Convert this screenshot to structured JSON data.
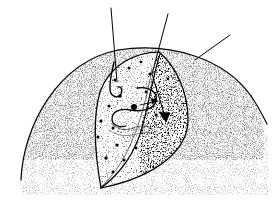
{
  "figure": {
    "title": "Stippled pen-and-ink anatomical illustration",
    "caption": "",
    "style": "pen-and-ink stipple engraving",
    "background_color": "#ffffff",
    "ink_color": "#000000",
    "stipple_color": "#111111",
    "line_weight_px": 1.1
  },
  "canvas": {
    "width": 276,
    "height": 210
  },
  "elements": {
    "outer_body": {
      "name": "outer stippled body mass",
      "description": "Large lightly stippled dome / rounded mass forming the background organ.",
      "outline_visible": true,
      "stipple_density": "light",
      "bounds": {
        "x": 20,
        "y": 47,
        "width": 248,
        "height": 140
      }
    },
    "central_organ": {
      "name": "central lens-shaped organ",
      "description": "Pointed-oval (leaf / lens) shaped organ tilted to the right, occupying the middle of the field.",
      "stipple_density": "medium",
      "tip_top": {
        "x": 160,
        "y": 52
      },
      "tip_bottom": {
        "x": 100,
        "y": 188
      },
      "bounds": {
        "x": 88,
        "y": 50,
        "width": 96,
        "height": 140
      }
    },
    "shaded_crescent": {
      "name": "dark shaded crescent",
      "description": "Heavily stippled / dense dark crescent along the right flank of the central organ indicating depth.",
      "stipple_density": "heavy",
      "bounds": {
        "x": 140,
        "y": 52,
        "width": 52,
        "height": 132
      }
    },
    "internal_hook": {
      "name": "hooked duct",
      "description": "Small hook-shaped internal line near upper-left of the central organ."
    },
    "internal_s_curve": {
      "name": "s-shaped structure",
      "description": "Open S / question-mark shaped internal line at the centre of the organ."
    },
    "internal_squiggle": {
      "name": "fine squiggle detail",
      "description": "Fine illegible cursive-like squiggle marks below the S-curve."
    },
    "arrow": {
      "name": "direction arrow",
      "description": "Small arrowhead at the end of the middle leader line pointing down-right into the shaded crescent.",
      "from": {
        "x": 152,
        "y": 74
      },
      "to": {
        "x": 167,
        "y": 122
      }
    },
    "dark_dots": {
      "name": "dark punctate spots",
      "description": "Scattered solid black dots (punctate markings) inside the central organ.",
      "count": 18,
      "points": [
        {
          "x": 129,
          "y": 68,
          "r": 1.5
        },
        {
          "x": 141,
          "y": 62,
          "r": 1.3
        },
        {
          "x": 115,
          "y": 80,
          "r": 1.4
        },
        {
          "x": 150,
          "y": 74,
          "r": 1.6
        },
        {
          "x": 168,
          "y": 79,
          "r": 1.3
        },
        {
          "x": 120,
          "y": 96,
          "r": 1.8
        },
        {
          "x": 109,
          "y": 106,
          "r": 1.6
        },
        {
          "x": 134,
          "y": 107,
          "r": 3.0
        },
        {
          "x": 146,
          "y": 92,
          "r": 1.4
        },
        {
          "x": 101,
          "y": 121,
          "r": 1.6
        },
        {
          "x": 113,
          "y": 128,
          "r": 1.5
        },
        {
          "x": 156,
          "y": 115,
          "r": 1.4
        },
        {
          "x": 98,
          "y": 137,
          "r": 1.5
        },
        {
          "x": 117,
          "y": 145,
          "r": 1.6
        },
        {
          "x": 106,
          "y": 158,
          "r": 1.7
        },
        {
          "x": 124,
          "y": 160,
          "r": 1.5
        },
        {
          "x": 136,
          "y": 148,
          "r": 1.4
        },
        {
          "x": 113,
          "y": 172,
          "r": 1.4
        }
      ]
    }
  },
  "leader_lines": [
    {
      "id": "leader-left",
      "label": "",
      "from": {
        "x": 111,
        "y": 8
      },
      "to": {
        "x": 117,
        "y": 82
      },
      "points_to": "internal hooked duct"
    },
    {
      "id": "leader-middle",
      "label": "",
      "from": {
        "x": 168,
        "y": 14
      },
      "to": {
        "x": 152,
        "y": 74
      },
      "points_to": "central organ upper margin"
    },
    {
      "id": "leader-right",
      "label": "",
      "from": {
        "x": 230,
        "y": 35
      },
      "to": {
        "x": 195,
        "y": 60
      },
      "points_to": "dark shaded crescent"
    }
  ],
  "annotations": {
    "visible_text": [],
    "note": "No legible lettering appears in the illustration; the only script-like marks are fine illustrative squiggles."
  }
}
